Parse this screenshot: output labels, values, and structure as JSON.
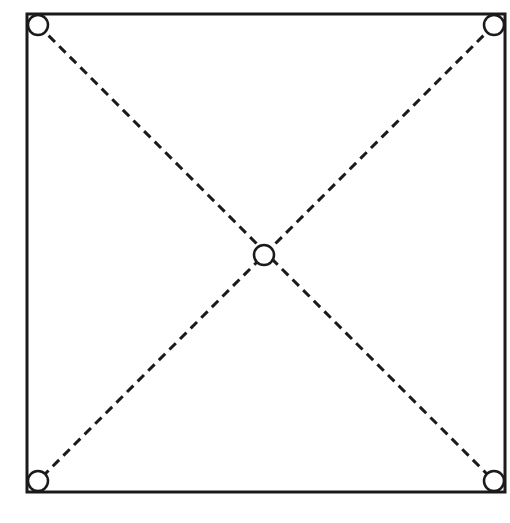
{
  "diagram": {
    "type": "square-with-diagonals",
    "stroke_color": "#1a1a1a",
    "fill_color": "#ffffff",
    "nodes": [
      {
        "id": "top-left",
        "position": "corner"
      },
      {
        "id": "top-right",
        "position": "corner"
      },
      {
        "id": "bottom-left",
        "position": "corner"
      },
      {
        "id": "bottom-right",
        "position": "corner"
      },
      {
        "id": "center",
        "position": "intersection"
      }
    ],
    "edges": [
      {
        "from": "top-left",
        "to": "bottom-right",
        "style": "dashed"
      },
      {
        "from": "top-right",
        "to": "bottom-left",
        "style": "dashed"
      }
    ]
  }
}
